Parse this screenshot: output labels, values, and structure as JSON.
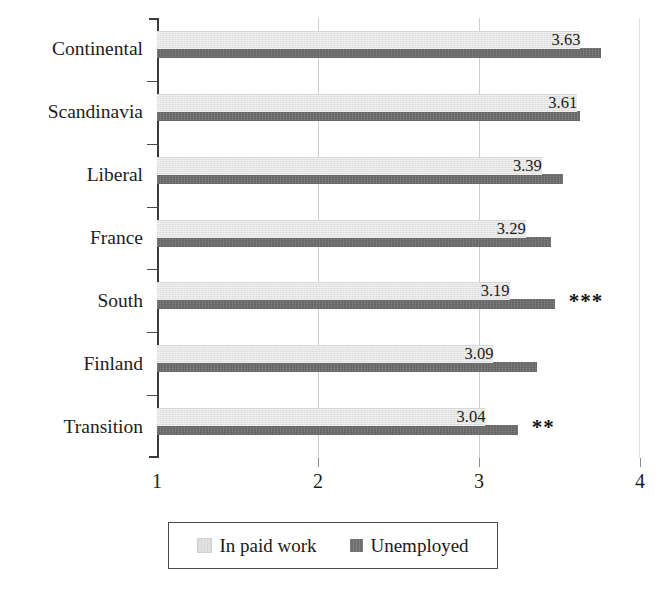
{
  "chart_data": {
    "type": "bar",
    "orientation": "horizontal",
    "title": "",
    "subtitle": "",
    "xlabel": "",
    "ylabel": "",
    "xlim": [
      1,
      4
    ],
    "xticks": [
      "1",
      "2",
      "3",
      "4"
    ],
    "xtick_values": [
      1,
      2,
      3,
      4
    ],
    "grid": "vertical gridlines at 2, 3 and 4",
    "legend_position": "bottom-center-boxed",
    "categories": [
      "Continental",
      "Scandinavia",
      "Liberal",
      "France",
      "South",
      "Finland",
      "Transition"
    ],
    "series": [
      {
        "name": "In paid work",
        "color": "#e2e2e2",
        "values": [
          3.63,
          3.61,
          3.39,
          3.29,
          3.19,
          3.09,
          3.04
        ],
        "labels": [
          "3.63",
          "3.61",
          "3.39",
          "3.29",
          "3.19",
          "3.09",
          "3.04"
        ]
      },
      {
        "name": "Unemployed",
        "color": "#6f6f6f",
        "values": [
          3.76,
          3.63,
          3.52,
          3.45,
          3.47,
          3.36,
          3.24
        ],
        "labels": [
          "",
          "",
          "",
          "",
          "",
          "",
          ""
        ]
      }
    ],
    "annotations": [
      {
        "category": "Continental",
        "text": ""
      },
      {
        "category": "Scandinavia",
        "text": ""
      },
      {
        "category": "Liberal",
        "text": ""
      },
      {
        "category": "France",
        "text": ""
      },
      {
        "category": "South",
        "text": "***"
      },
      {
        "category": "Finland",
        "text": ""
      },
      {
        "category": "Transition",
        "text": "**"
      }
    ]
  },
  "legend": {
    "entries": [
      {
        "label": "In paid work",
        "swatch": "light-gray-swatch-icon"
      },
      {
        "label": "Unemployed",
        "swatch": "dark-gray-swatch-icon"
      }
    ]
  },
  "axis": {
    "x_tick_labels": [
      "1",
      "2",
      "3",
      "4"
    ],
    "y_tick_labels": [
      "Continental",
      "Scandinavia",
      "Liberal",
      "France",
      "South",
      "Finland",
      "Transition"
    ]
  },
  "colors": {
    "series_in_paid_work": "#e2e2e2",
    "series_unemployed": "#6f6f6f",
    "axis": "#3a3a3a",
    "gridline": "#cfcfcf",
    "text": "#1a1a1a",
    "background": "#ffffff"
  }
}
